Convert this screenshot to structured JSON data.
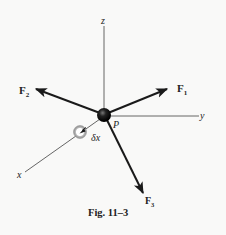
{
  "figure": {
    "caption": "Fig. 11–3",
    "axes": {
      "x": "x",
      "y": "y",
      "z": "z"
    },
    "point_label": "P",
    "displacement_label": "δx",
    "forces": [
      {
        "name": "F",
        "sub": "1"
      },
      {
        "name": "F",
        "sub": "2"
      },
      {
        "name": "F",
        "sub": "3"
      }
    ],
    "colors": {
      "background": "#f9f9f8",
      "lines": "#1a1a1a",
      "axes": "#555555",
      "particle": "#111111",
      "displaced_particle": "#9a9a9a"
    }
  }
}
